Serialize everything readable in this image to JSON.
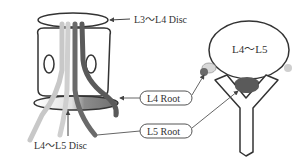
{
  "labels": {
    "l3_l4_disc": "L3～L4 Disc",
    "l4_l5_disc": "L4～L5 Disc",
    "l4_l5_body": "L4～L5",
    "l4_root": "L4 Root",
    "l5_root": "L5 Root"
  },
  "colors": {
    "outline": "#333333",
    "light_nerve": "#c8c8c8",
    "mid_nerve": "#8a8a8a",
    "dark_nerve": "#5a5a5a",
    "disc_shade": "#7a7a7a",
    "leader": "#666666"
  }
}
